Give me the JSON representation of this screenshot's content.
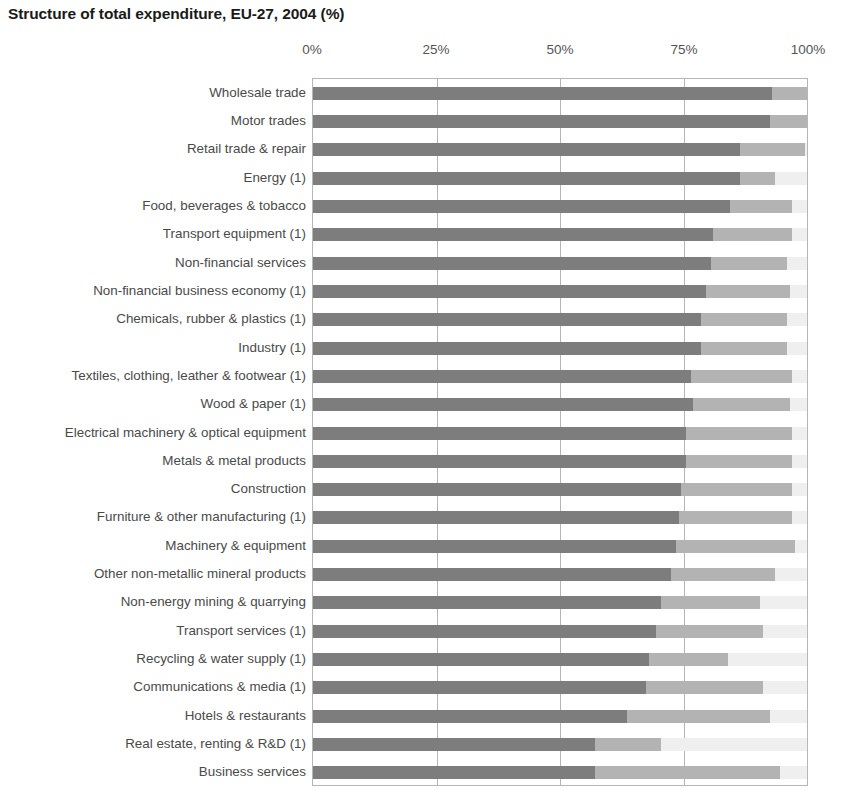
{
  "title": "Structure of total expenditure, EU-27, 2004 (%)",
  "colors": {
    "segment_1": "#7d7d7d",
    "segment_2": "#b3b3b3",
    "segment_3": "#efefef",
    "grid": "#b6b6b6",
    "label_text": "#4a4a4a",
    "title_text": "#1a1a1a"
  },
  "chart_data": {
    "type": "bar",
    "subtype": "stacked-horizontal-100-percent",
    "title": "Structure of total expenditure, EU-27, 2004 (%)",
    "xlabel": "",
    "ylabel": "",
    "xlim": [
      0,
      100
    ],
    "grid": true,
    "grid_axis": "x",
    "legend": "none",
    "orientation": "horizontal",
    "tick_labels": [
      "0%",
      "25%",
      "50%",
      "75%",
      "100%"
    ],
    "tick_values": [
      0,
      25,
      50,
      75,
      100
    ],
    "categories": [
      "Wholesale trade",
      "Motor trades",
      "Retail trade & repair",
      "Energy (1)",
      "Food, beverages & tobacco",
      "Transport equipment (1)",
      "Non-financial services",
      "Non-financial business economy (1)",
      "Chemicals, rubber & plastics (1)",
      "Industry (1)",
      "Textiles, clothing, leather & footwear (1)",
      "Wood & paper (1)",
      "Electrical machinery & optical equipment",
      "Metals & metal products",
      "Construction",
      "Furniture & other manufacturing (1)",
      "Machinery & equipment",
      "Other non-metallic mineral products",
      "Non-energy mining & quarrying",
      "Transport services (1)",
      "Recycling & water supply (1)",
      "Communications & media (1)",
      "Hotels & restaurants",
      "Real estate, renting & R&D (1)",
      "Business services"
    ],
    "series": [
      {
        "name": "Purchases of goods and services",
        "color": "#7d7d7d",
        "values": [
          93.0,
          92.5,
          86.5,
          86.5,
          84.5,
          81.0,
          80.5,
          79.5,
          78.5,
          78.5,
          76.5,
          77.0,
          75.5,
          75.5,
          74.5,
          74.0,
          73.5,
          72.5,
          70.5,
          69.5,
          68.0,
          67.5,
          63.5,
          57.0,
          57.0
        ]
      },
      {
        "name": "Personnel costs",
        "color": "#b3b3b3",
        "values": [
          7.0,
          7.5,
          13.0,
          7.0,
          12.5,
          16.0,
          15.5,
          17.0,
          17.5,
          17.5,
          20.5,
          19.5,
          21.5,
          21.5,
          22.5,
          23.0,
          24.0,
          21.0,
          20.0,
          21.5,
          16.0,
          23.5,
          29.0,
          13.5,
          37.5
        ]
      },
      {
        "name": "Other (investment / residual)",
        "color": "#efefef",
        "values": [
          0.0,
          0.0,
          0.5,
          6.5,
          3.0,
          3.0,
          4.0,
          3.5,
          4.0,
          4.0,
          3.0,
          3.5,
          3.0,
          3.0,
          3.0,
          3.0,
          2.5,
          6.5,
          9.5,
          9.0,
          16.0,
          9.0,
          7.5,
          29.5,
          5.5
        ]
      }
    ]
  }
}
